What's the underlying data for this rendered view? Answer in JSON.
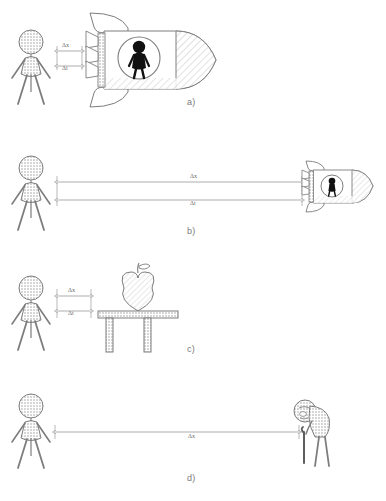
{
  "document": {
    "type": "physics-figure",
    "description": "Four-panel line-art diagram illustrating displacement and time interval measurements",
    "background_color": "#ffffff",
    "line_color": "#6f6f6f",
    "fill_light": "#e9e9e9",
    "fill_dark": "#111111"
  },
  "symbols": {
    "delta_x": "Δx",
    "delta_t": "Δt"
  },
  "panels": [
    {
      "id": "a",
      "label": "a)",
      "scene": "observer-beside-large-rocket",
      "measurements": [
        {
          "name": "delta-x",
          "text": "Δx"
        },
        {
          "name": "delta-t",
          "text": "Δt"
        }
      ],
      "objects": [
        "stick-figure-observer",
        "rocket-large",
        "porthole-astronaut"
      ]
    },
    {
      "id": "b",
      "label": "b)",
      "scene": "observer-far-from-small-rocket",
      "measurements": [
        {
          "name": "delta-x",
          "text": "Δx"
        },
        {
          "name": "delta-t",
          "text": "Δt"
        }
      ],
      "objects": [
        "stick-figure-observer",
        "rocket-small",
        "porthole-astronaut"
      ]
    },
    {
      "id": "c",
      "label": "c)",
      "scene": "observer-beside-apple-on-table",
      "measurements": [
        {
          "name": "delta-x",
          "text": "Δx"
        },
        {
          "name": "delta-t",
          "text": "Δt"
        }
      ],
      "objects": [
        "stick-figure-observer",
        "apple",
        "table"
      ]
    },
    {
      "id": "d",
      "label": "d)",
      "scene": "observer-far-from-elderly-figure",
      "measurements": [
        {
          "name": "delta-x",
          "text": "Δx"
        }
      ],
      "objects": [
        "stick-figure-observer",
        "elderly-figure-with-cane"
      ]
    }
  ]
}
